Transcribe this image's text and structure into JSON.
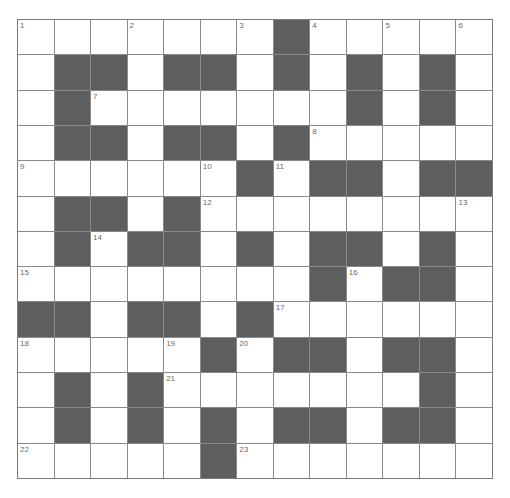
{
  "puzzle": {
    "rows": 13,
    "cols": 13,
    "grid": [
      "#######B#####",
      "#BB#BB#B#B#B#",
      "#B#######B#B#",
      "#BB#BB#B#####",
      "######B#BB#BB",
      "#BB#B########",
      "#B#BB#B#BB#B#",
      "########B#BB#",
      "BB#BB#B######",
      "#####B#BB#BB#",
      "#B#B#######B#",
      "#B#B#B#BB#BB#",
      "#####B#######"
    ],
    "numbers": [
      {
        "r": 0,
        "c": 0,
        "n": "1"
      },
      {
        "r": 0,
        "c": 3,
        "n": "2"
      },
      {
        "r": 0,
        "c": 6,
        "n": "3"
      },
      {
        "r": 0,
        "c": 8,
        "n": "4"
      },
      {
        "r": 0,
        "c": 10,
        "n": "5"
      },
      {
        "r": 0,
        "c": 12,
        "n": "6"
      },
      {
        "r": 2,
        "c": 2,
        "n": "7"
      },
      {
        "r": 3,
        "c": 8,
        "n": "8"
      },
      {
        "r": 4,
        "c": 0,
        "n": "9"
      },
      {
        "r": 4,
        "c": 5,
        "n": "10"
      },
      {
        "r": 4,
        "c": 7,
        "n": "11"
      },
      {
        "r": 5,
        "c": 5,
        "n": "12"
      },
      {
        "r": 5,
        "c": 12,
        "n": "13"
      },
      {
        "r": 6,
        "c": 2,
        "n": "14"
      },
      {
        "r": 7,
        "c": 0,
        "n": "15"
      },
      {
        "r": 7,
        "c": 9,
        "n": "16"
      },
      {
        "r": 8,
        "c": 7,
        "n": "17"
      },
      {
        "r": 9,
        "c": 0,
        "n": "18"
      },
      {
        "r": 9,
        "c": 4,
        "n": "19"
      },
      {
        "r": 9,
        "c": 6,
        "n": "20"
      },
      {
        "r": 10,
        "c": 4,
        "n": "21"
      },
      {
        "r": 12,
        "c": 0,
        "n": "22"
      },
      {
        "r": 12,
        "c": 6,
        "n": "23"
      }
    ],
    "colors": {
      "block": "#5e5e5e",
      "grid_line": "#8a8a8a",
      "number": "#6a6a6a"
    }
  }
}
